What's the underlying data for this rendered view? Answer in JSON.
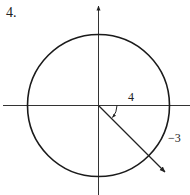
{
  "problem_number": "4.",
  "diagram": {
    "type": "unit-circle-angle",
    "center": [
      98.5,
      105.5
    ],
    "radius": 71,
    "labels": {
      "x_component": "4",
      "y_component": "−3"
    },
    "colors": {
      "stroke": "#1a1a1a",
      "axis": "#333333"
    }
  }
}
